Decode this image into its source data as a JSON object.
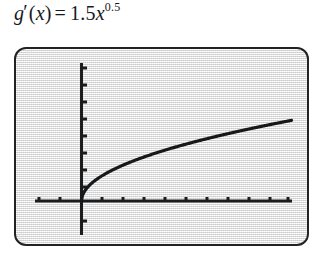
{
  "equation": {
    "function_name": "g",
    "prime": "′",
    "open_paren": "(",
    "variable": "x",
    "close_paren": ")",
    "equals": "=",
    "coefficient": "1.5",
    "base_variable": "x",
    "exponent": "0.5",
    "full_text": "g'(x) = 1.5x^0.5"
  },
  "screen": {
    "background_color": "#e3e3e3",
    "border_color": "#202225",
    "curve_color": "#16181a",
    "axis_color": "#1a1c1e"
  },
  "chart_data": {
    "type": "line",
    "expression": "y = 1.5 * x^0.5",
    "xlabel": "",
    "ylabel": "",
    "xlim": [
      -2.6,
      10.5
    ],
    "ylim": [
      -1.5,
      7.5
    ],
    "grid": false,
    "legend": "none",
    "axes": {
      "x_axis_visible": true,
      "y_axis_visible": true,
      "x_tick_count": 13,
      "y_tick_count": 9,
      "x_tick_values": [
        -2,
        -1,
        0,
        1,
        2,
        3,
        4,
        5,
        6,
        7,
        8,
        9,
        10
      ],
      "y_tick_values": [
        -1,
        1,
        2,
        3,
        4,
        5,
        6,
        7
      ],
      "tick_labels_shown": false
    },
    "series": [
      {
        "name": "g'(x) = 1.5x^0.5",
        "domain": [
          0,
          10
        ],
        "x": [
          0,
          0.1,
          0.2,
          0.35,
          0.5,
          0.75,
          1,
          1.5,
          2,
          2.5,
          3,
          3.5,
          4,
          5,
          6,
          7,
          8,
          9,
          10
        ],
        "y": [
          0,
          0.474,
          0.671,
          0.887,
          1.061,
          1.299,
          1.5,
          1.837,
          2.121,
          2.372,
          2.598,
          2.806,
          3.0,
          3.354,
          3.674,
          3.969,
          4.243,
          4.5,
          4.743
        ]
      }
    ]
  }
}
